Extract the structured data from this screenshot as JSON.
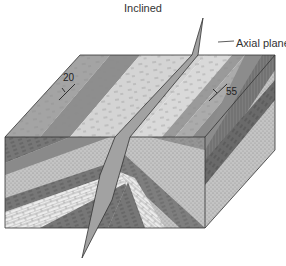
{
  "diagram": {
    "title": "Inclined",
    "type": "block diagram of an inclined fold",
    "labels": {
      "axial_plane": "Axial plane",
      "dip_left": "20",
      "dip_right": "55"
    },
    "features": {
      "top_surface": "outcrop pattern of folded strata with strike-and-dip symbols",
      "front_face": "cross-section showing folded layers: dark shale, stippled sandstone, limestone (brick pattern)",
      "right_face": "cross-section of layers dipping steeply",
      "axial_plane": "inclined plane cutting through the fold hinge"
    },
    "colors": {
      "band_dark": "#8c8c8c",
      "band_mid": "#a8a8a8",
      "band_light": "#d6d6d6",
      "sandstone": "#bdbdbd",
      "limestone": "#e8e8e8",
      "shale": "#6e6e6e",
      "axial_plane": "#9a9a9a",
      "outline": "#333333"
    }
  }
}
